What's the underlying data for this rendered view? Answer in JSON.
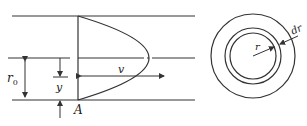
{
  "diagram": {
    "left_figure": {
      "description": "Laminar flow velocity profile in a pipe",
      "labels": {
        "radius": "r",
        "radius_sub": "0",
        "distance": "y",
        "velocity": "v",
        "point": "A"
      }
    },
    "right_figure": {
      "description": "Pipe cross-section with annular ring element",
      "labels": {
        "radius": "r",
        "ring_width": "dr"
      }
    },
    "colors": {
      "line": "#333333",
      "background": "#ffffff"
    }
  }
}
